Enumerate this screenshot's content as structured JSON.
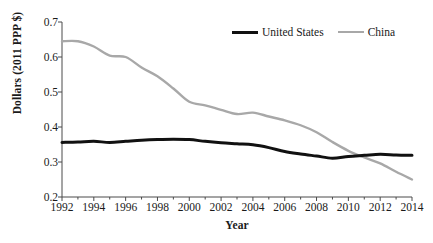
{
  "chart_data": {
    "type": "line",
    "title": "",
    "xlabel": "Year",
    "ylabel": "Dollars (2011 PPP $)",
    "xlim": [
      1992,
      2014
    ],
    "ylim": [
      0.2,
      0.7
    ],
    "xticks": [
      1992,
      1994,
      1996,
      1998,
      2000,
      2002,
      2004,
      2006,
      2008,
      2010,
      2012,
      2014
    ],
    "xtick_labels": [
      "1992",
      "1994",
      "1996",
      "1998",
      "2000",
      "2002",
      "2004",
      "2006",
      "2008",
      "2010",
      "2012",
      "2014"
    ],
    "yticks": [
      0.2,
      0.3,
      0.4,
      0.5,
      0.6,
      0.7
    ],
    "ytick_labels": [
      "0.2",
      "0.3",
      "0.4",
      "0.5",
      "0.6",
      "0.7"
    ],
    "grid": false,
    "legend_position": "top-right",
    "x": [
      1992,
      1993,
      1994,
      1995,
      1996,
      1997,
      1998,
      1999,
      2000,
      2001,
      2002,
      2003,
      2004,
      2005,
      2006,
      2007,
      2008,
      2009,
      2010,
      2011,
      2012,
      2013,
      2014
    ],
    "series": [
      {
        "name": "United States",
        "color": "#111111",
        "width": 3,
        "values": [
          0.356,
          0.357,
          0.359,
          0.356,
          0.359,
          0.362,
          0.364,
          0.365,
          0.364,
          0.359,
          0.355,
          0.352,
          0.349,
          0.341,
          0.33,
          0.323,
          0.317,
          0.311,
          0.316,
          0.319,
          0.322,
          0.32,
          0.319
        ]
      },
      {
        "name": "China",
        "color": "#a8a8a8",
        "width": 2.4,
        "values": [
          0.645,
          0.645,
          0.63,
          0.604,
          0.6,
          0.57,
          0.545,
          0.51,
          0.472,
          0.462,
          0.449,
          0.437,
          0.441,
          0.43,
          0.419,
          0.405,
          0.385,
          0.357,
          0.332,
          0.313,
          0.296,
          0.272,
          0.25
        ]
      }
    ]
  },
  "legend": {
    "entries": [
      {
        "label": "United States",
        "color": "#111111",
        "style": "thick"
      },
      {
        "label": "China",
        "color": "#a8a8a8",
        "style": "thin"
      }
    ]
  },
  "axes": {
    "y_title": "Dollars (2011 PPP $)",
    "x_title": "Year"
  }
}
